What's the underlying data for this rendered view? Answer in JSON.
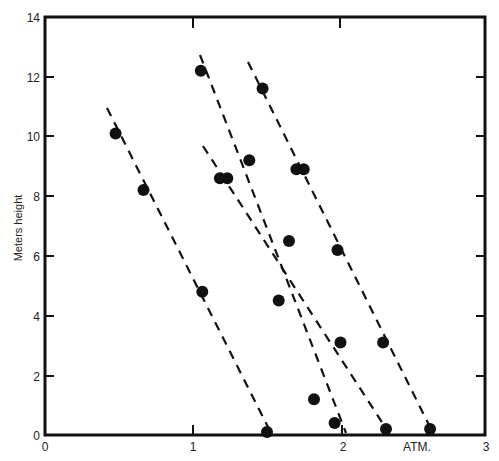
{
  "chart_data": {
    "type": "scatter",
    "title": "",
    "xlabel": "ATM.",
    "ylabel": "Meters height",
    "xlim": [
      0,
      3
    ],
    "ylim": [
      0,
      14
    ],
    "x_ticks": [
      "0",
      "1",
      "2",
      "3"
    ],
    "y_ticks": [
      "0",
      "2",
      "4",
      "6",
      "8",
      "10",
      "12",
      "14"
    ],
    "grid": false,
    "legend": null,
    "points": [
      {
        "x": 0.48,
        "y": 10.1
      },
      {
        "x": 0.67,
        "y": 8.2
      },
      {
        "x": 1.07,
        "y": 4.8
      },
      {
        "x": 1.51,
        "y": 0.1
      },
      {
        "x": 1.06,
        "y": 12.2
      },
      {
        "x": 1.39,
        "y": 9.2
      },
      {
        "x": 1.66,
        "y": 6.5
      },
      {
        "x": 2.01,
        "y": 3.1
      },
      {
        "x": 1.97,
        "y": 0.4
      },
      {
        "x": 1.19,
        "y": 8.6
      },
      {
        "x": 1.24,
        "y": 8.6
      },
      {
        "x": 1.59,
        "y": 4.5
      },
      {
        "x": 1.83,
        "y": 1.2
      },
      {
        "x": 2.32,
        "y": 0.2
      },
      {
        "x": 1.48,
        "y": 11.6
      },
      {
        "x": 1.71,
        "y": 8.9
      },
      {
        "x": 1.76,
        "y": 8.9
      },
      {
        "x": 1.99,
        "y": 6.2
      },
      {
        "x": 2.3,
        "y": 3.1
      },
      {
        "x": 2.62,
        "y": 0.2
      }
    ],
    "series": [
      {
        "name": "line 1 (dashed fit)",
        "x": [
          0.42,
          1.53
        ],
        "y": [
          10.9,
          0.05
        ]
      },
      {
        "name": "line 2 (dashed fit)",
        "x": [
          1.05,
          2.05
        ],
        "y": [
          12.7,
          0.05
        ]
      },
      {
        "name": "line 3 (dashed fit)",
        "x": [
          1.07,
          2.34
        ],
        "y": [
          9.7,
          0.05
        ]
      },
      {
        "name": "line 4 (dashed fit)",
        "x": [
          1.38,
          2.64
        ],
        "y": [
          12.5,
          0.05
        ]
      }
    ]
  }
}
